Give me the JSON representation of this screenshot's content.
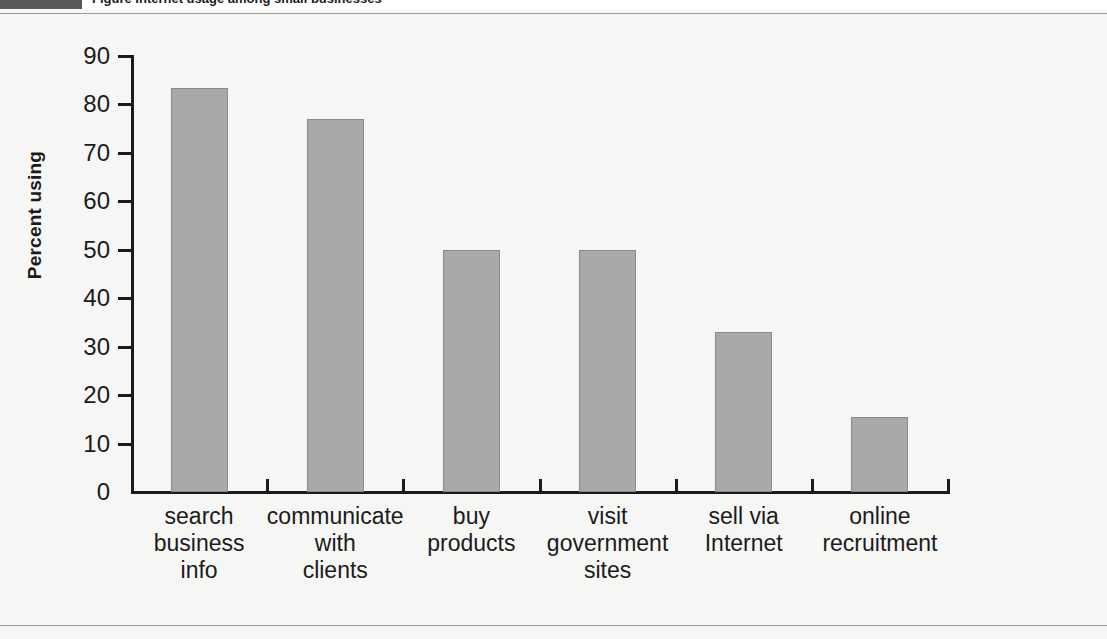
{
  "figure": {
    "caption_tag": "",
    "caption_text": "Figure  Internet usage among small businesses",
    "background_color": "#f6f6f5",
    "bar_color": "#a9a9a9",
    "axis_color": "#1b1b1b"
  },
  "chart_data": {
    "type": "bar",
    "title": "",
    "xlabel": "",
    "ylabel": "Percent using",
    "ylim": [
      0,
      90
    ],
    "ytick_step": 10,
    "ytick_labels": [
      "90",
      "80",
      "70",
      "60",
      "50",
      "40",
      "30",
      "20",
      "10",
      "0"
    ],
    "grid": false,
    "legend": "none",
    "categories": [
      "search business info",
      "communicate with clients",
      "buy products",
      "visit government sites",
      "sell via Internet",
      "online recruitment"
    ],
    "category_lines": [
      [
        "search",
        "business",
        "info"
      ],
      [
        "communicate",
        "with",
        "clients"
      ],
      [
        "buy",
        "products"
      ],
      [
        "visit",
        "government",
        "sites"
      ],
      [
        "sell via",
        "Internet"
      ],
      [
        "online",
        "recruitment"
      ]
    ],
    "values": [
      83.5,
      77,
      50,
      50,
      33,
      15.5
    ]
  }
}
